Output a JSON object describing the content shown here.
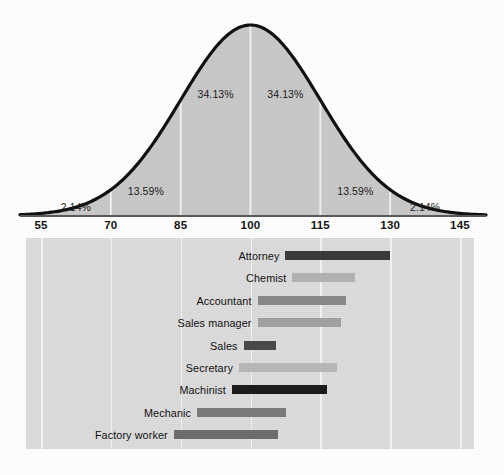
{
  "figure": {
    "background": "#ffffff"
  },
  "colors": {
    "curve_stroke": "#111111",
    "curve_fill": "#c9c9c9",
    "panel_bg": "#dcdcdc",
    "gridline": "#f4f4f4",
    "axis": "#5a5a5a",
    "text": "#141414"
  },
  "chart_data": {
    "type": "area",
    "title": "",
    "subtitle": "",
    "xlabel": "",
    "ylabel": "",
    "xlim": [
      48,
      152
    ],
    "grid": true,
    "legend": "none",
    "distribution": {
      "kind": "normal",
      "mean": 100,
      "sd": 15,
      "peak_value": 100
    },
    "x_ticks": [
      55,
      70,
      85,
      100,
      115,
      130,
      145
    ],
    "x_tick_labels": [
      "55",
      "70",
      "85",
      "100",
      "115",
      "130",
      "145"
    ],
    "region_labels": [
      {
        "label": "2.14%",
        "value": 2.14,
        "range": [
          55,
          70
        ],
        "center": 62.5
      },
      {
        "label": "13.59%",
        "value": 13.59,
        "range": [
          70,
          85
        ],
        "center": 77.5
      },
      {
        "label": "34.13%",
        "value": 34.13,
        "range": [
          85,
          100
        ],
        "center": 92.5
      },
      {
        "label": "34.13%",
        "value": 34.13,
        "range": [
          100,
          115
        ],
        "center": 107.5
      },
      {
        "label": "13.59%",
        "value": 13.59,
        "range": [
          115,
          130
        ],
        "center": 122.5
      },
      {
        "label": "2.14%",
        "value": 2.14,
        "range": [
          130,
          145
        ],
        "center": 137.5
      }
    ],
    "occupations": {
      "type": "range-bar",
      "xlabel": "IQ score",
      "categories": [
        "Attorney",
        "Chemist",
        "Accountant",
        "Sales manager",
        "Sales",
        "Secretary",
        "Machinist",
        "Mechanic",
        "Factory worker"
      ],
      "rows": [
        {
          "name": "Attorney",
          "low": 107.5,
          "high": 130.0,
          "shade": "#3a3a3a"
        },
        {
          "name": "Chemist",
          "low": 109.0,
          "high": 122.5,
          "shade": "#b3b3b3"
        },
        {
          "name": "Accountant",
          "low": 101.5,
          "high": 120.5,
          "shade": "#8a8a8a"
        },
        {
          "name": "Sales manager",
          "low": 101.5,
          "high": 119.5,
          "shade": "#a2a2a2"
        },
        {
          "name": "Sales",
          "low": 98.5,
          "high": 105.5,
          "shade": "#4a4a4a"
        },
        {
          "name": "Secretary",
          "low": 97.5,
          "high": 118.5,
          "shade": "#b8b8b8"
        },
        {
          "name": "Machinist",
          "low": 96.0,
          "high": 116.5,
          "shade": "#1c1c1c"
        },
        {
          "name": "Mechanic",
          "low": 88.5,
          "high": 107.5,
          "shade": "#7b7b7b"
        },
        {
          "name": "Factory worker",
          "low": 83.5,
          "high": 106.0,
          "shade": "#6e6e6e"
        }
      ]
    }
  }
}
